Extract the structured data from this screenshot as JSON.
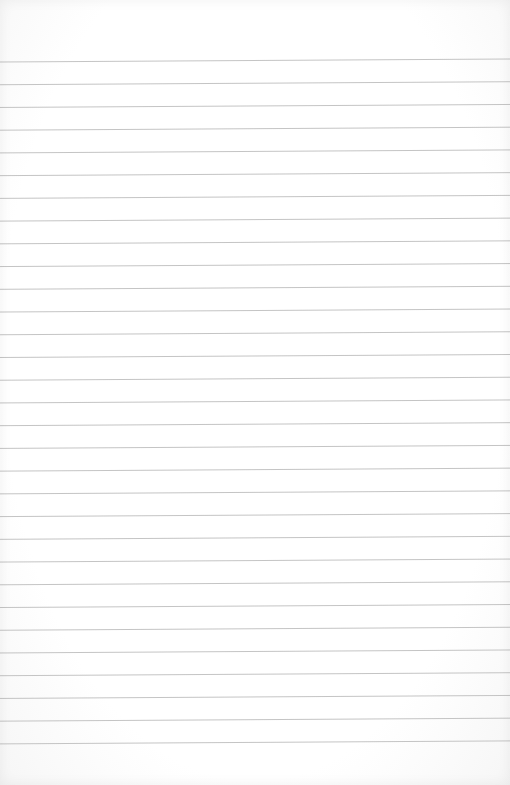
{
  "page": {
    "type": "blank ruled notebook paper",
    "background_color": "#ffffff",
    "line_color": "#bdbdbd"
  },
  "ruling": {
    "line_count": 31,
    "first_line_y": 62,
    "line_spacing": 22.73,
    "left_x": 0,
    "right_x": 510,
    "right_end_rise": 3,
    "stroke_width": 0.9
  }
}
